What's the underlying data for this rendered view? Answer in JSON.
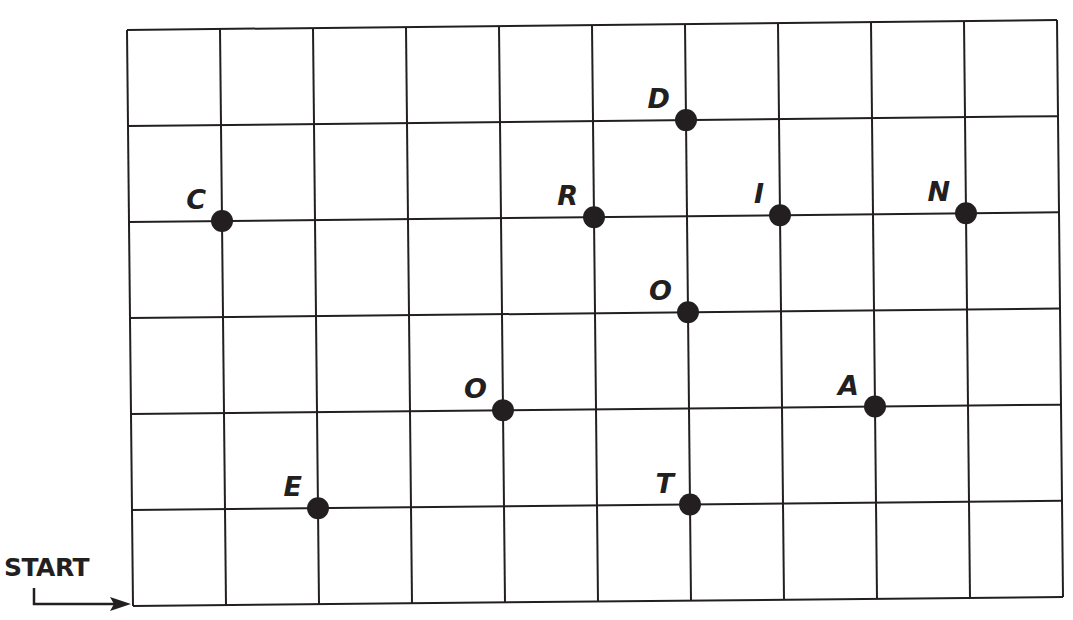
{
  "diagram": {
    "type": "coordinate-grid-puzzle",
    "start_label": "START",
    "grid": {
      "columns": 10,
      "rows": 6,
      "origin": "bottom-left (START)",
      "line_color": "#231f20"
    },
    "points": [
      {
        "letter": "C",
        "x": 1,
        "y": 4
      },
      {
        "letter": "R",
        "x": 5,
        "y": 4
      },
      {
        "letter": "D",
        "x": 6,
        "y": 5
      },
      {
        "letter": "I",
        "x": 7,
        "y": 4
      },
      {
        "letter": "N",
        "x": 9,
        "y": 4
      },
      {
        "letter": "O",
        "x": 6,
        "y": 3
      },
      {
        "letter": "O",
        "x": 4,
        "y": 2
      },
      {
        "letter": "A",
        "x": 8,
        "y": 2
      },
      {
        "letter": "E",
        "x": 2,
        "y": 1
      },
      {
        "letter": "T",
        "x": 6,
        "y": 1
      }
    ],
    "dot_color": "#231f20"
  }
}
